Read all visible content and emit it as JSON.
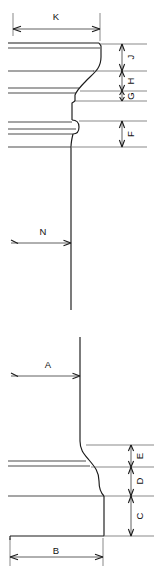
{
  "drawing": {
    "title": "Column capital and base profile",
    "background_color": "#ffffff",
    "line_color": "#1a1a1a",
    "width": 158,
    "height": 571,
    "views": [
      {
        "name": "upper-view",
        "description": "Capital / cornice profile with cyma recta curve and bead molding"
      },
      {
        "name": "lower-view",
        "description": "Base profile with reverse ogee flare and plinth block"
      }
    ]
  },
  "dimensions": {
    "K": {
      "label": "K",
      "orientation": "horizontal",
      "view": "upper-view",
      "label_x": 56,
      "label_y": 17,
      "line_y": 29,
      "x_start": 13,
      "x_end": 100
    },
    "J": {
      "label": "J",
      "orientation": "vertical",
      "view": "upper-view",
      "label_x": 130,
      "label_y": 57,
      "line_x": 122,
      "y_start": 44,
      "y_end": 71
    },
    "H": {
      "label": "H",
      "orientation": "vertical",
      "view": "upper-view",
      "label_x": 130,
      "label_y": 81,
      "line_x": 122,
      "y_start": 71,
      "y_end": 91
    },
    "G": {
      "label": "G",
      "orientation": "vertical",
      "view": "upper-view",
      "label_x": 130,
      "label_y": 96,
      "line_x": 122,
      "y_start": 91,
      "y_end": 101
    },
    "F": {
      "label": "F",
      "orientation": "vertical",
      "view": "upper-view",
      "label_x": 130,
      "label_y": 134,
      "line_x": 122,
      "y_start": 121,
      "y_end": 147
    },
    "N": {
      "label": "N",
      "orientation": "leader",
      "view": "upper-view",
      "label_x": 43,
      "label_y": 232,
      "line_y": 243,
      "x_start": 11,
      "x_end": 72
    },
    "A": {
      "label": "A",
      "orientation": "leader",
      "view": "lower-view",
      "label_x": 48,
      "label_y": 365,
      "line_y": 376,
      "x_start": 11,
      "x_end": 80
    },
    "E": {
      "label": "E",
      "orientation": "vertical",
      "view": "lower-view",
      "label_x": 139,
      "label_y": 456,
      "line_x": 131,
      "y_start": 445,
      "y_end": 467
    },
    "D": {
      "label": "D",
      "orientation": "vertical",
      "view": "lower-view",
      "label_x": 139,
      "label_y": 481,
      "line_x": 131,
      "y_start": 467,
      "y_end": 496
    },
    "C": {
      "label": "C",
      "orientation": "vertical",
      "view": "lower-view",
      "label_x": 139,
      "label_y": 516,
      "line_x": 131,
      "y_start": 496,
      "y_end": 536
    },
    "B": {
      "label": "B",
      "orientation": "horizontal",
      "view": "lower-view",
      "label_x": 56,
      "label_y": 551,
      "line_y": 557,
      "x_start": 10,
      "x_end": 103
    }
  }
}
